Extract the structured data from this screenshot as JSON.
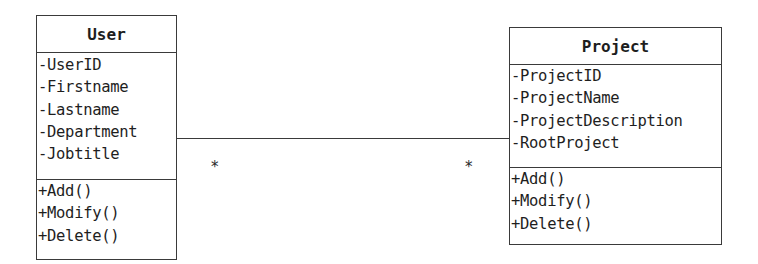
{
  "diagram": {
    "type": "UML class diagram",
    "classes": [
      {
        "name": "User",
        "attributes": [
          "-UserID",
          "-Firstname",
          "-Lastname",
          "-Department",
          "-Jobtitle"
        ],
        "methods": [
          "+Add()",
          "+Modify()",
          "+Delete()"
        ]
      },
      {
        "name": "Project",
        "attributes": [
          "-ProjectID",
          "-ProjectName",
          "-ProjectDescription",
          "-RootProject"
        ],
        "methods": [
          "+Add()",
          "+Modify()",
          "+Delete()"
        ]
      }
    ],
    "associations": [
      {
        "from": "User",
        "to": "Project",
        "from_multiplicity": "*",
        "to_multiplicity": "*"
      }
    ]
  }
}
